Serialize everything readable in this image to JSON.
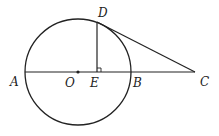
{
  "diagram": {
    "type": "geometry",
    "labels": {
      "A": "A",
      "B": "B",
      "C": "C",
      "D": "D",
      "E": "E",
      "O": "O"
    },
    "elements": [
      {
        "kind": "circle",
        "center": "O"
      },
      {
        "kind": "segment",
        "from": "A",
        "to": "C"
      },
      {
        "kind": "segment",
        "from": "D",
        "to": "E",
        "note": "perpendicular to AC at E (right-angle mark)"
      },
      {
        "kind": "segment",
        "from": "D",
        "to": "C",
        "note": "tangent at D"
      },
      {
        "kind": "point",
        "at": "O"
      }
    ]
  }
}
